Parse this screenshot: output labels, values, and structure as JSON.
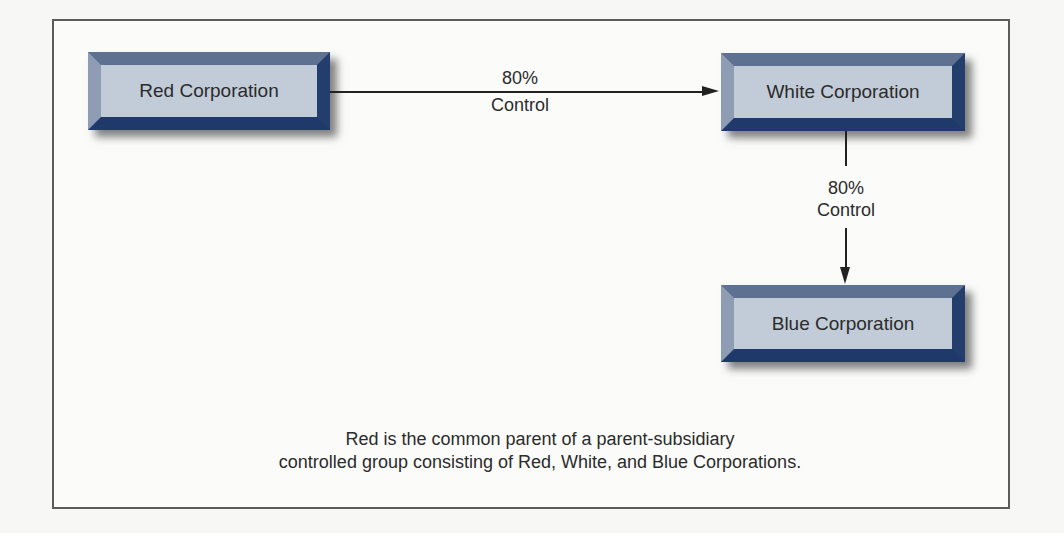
{
  "diagram": {
    "type": "ownership-structure",
    "nodes": [
      {
        "id": "red",
        "label": "Red Corporation"
      },
      {
        "id": "white",
        "label": "White Corporation"
      },
      {
        "id": "blue",
        "label": "Blue Corporation"
      }
    ],
    "edges": [
      {
        "from": "red",
        "to": "white",
        "percent": "80%",
        "label": "Control"
      },
      {
        "from": "white",
        "to": "blue",
        "percent": "80%",
        "label": "Control"
      }
    ],
    "caption": {
      "line1": "Red is the common parent of a parent-subsidiary",
      "line2": "controlled group consisting of Red, White, and Blue Corporations."
    }
  },
  "colors": {
    "box_face": "#c2ccd9",
    "bevel_dark": "#1f3a6a",
    "bevel_light": "#8e9db4",
    "text": "#2b2b2b",
    "frame": "#5c5c5c"
  }
}
